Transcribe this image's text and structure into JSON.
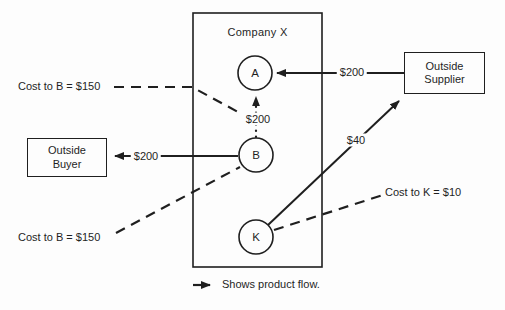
{
  "diagram": {
    "title": "Company X",
    "nodes": {
      "a": "A",
      "b": "B",
      "k": "K"
    },
    "external": {
      "buyer": {
        "line1": "Outside",
        "line2": "Buyer"
      },
      "supplier": {
        "line1": "Outside",
        "line2": "Supplier"
      }
    },
    "flows": {
      "supplier_to_a": "$200",
      "b_to_buyer": "$200",
      "b_to_a": "$200",
      "k_to_supplier": "$40"
    },
    "annotations": {
      "cost_to_b_top": "Cost to B = $150",
      "cost_to_b_bottom": "Cost to B = $150",
      "cost_to_k": "Cost to K = $10"
    },
    "legend": "Shows product flow.",
    "colors": {
      "ink": "#1f1f1f",
      "background": "#fdfdfd"
    }
  }
}
